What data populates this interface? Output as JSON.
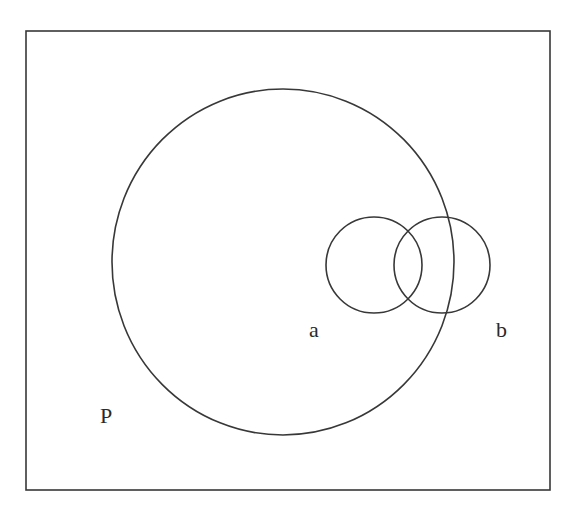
{
  "diagram": {
    "type": "venn",
    "universe": {
      "label": "P",
      "rect": {
        "x": 26,
        "y": 31,
        "width": 524,
        "height": 459
      },
      "label_pos": {
        "x": 100,
        "y": 423
      }
    },
    "sets": [
      {
        "id": "large",
        "label": "a",
        "shape": {
          "cx": 283,
          "cy": 262,
          "rx": 171,
          "ry": 173
        },
        "label_pos": {
          "x": 309,
          "y": 337
        }
      },
      {
        "id": "small-left",
        "label": "",
        "shape": {
          "cx": 374,
          "cy": 265,
          "rx": 48,
          "ry": 48
        }
      },
      {
        "id": "small-right",
        "label": "b",
        "shape": {
          "cx": 442,
          "cy": 265,
          "rx": 48,
          "ry": 48
        },
        "label_pos": {
          "x": 496,
          "y": 337
        }
      }
    ],
    "colors": {
      "stroke": "#383838",
      "text": "#2a2a2a",
      "background": "#ffffff"
    }
  }
}
